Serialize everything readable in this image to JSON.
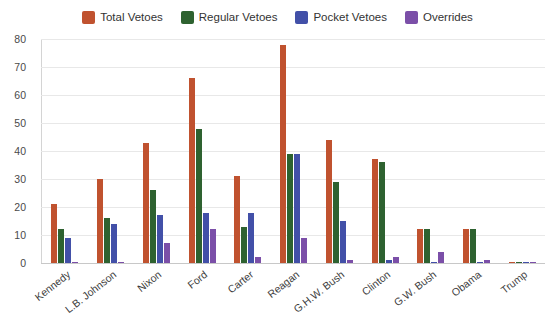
{
  "chart_data": {
    "type": "bar",
    "title": "",
    "subtitle": "",
    "xlabel": "",
    "ylabel": "",
    "ylim": [
      0,
      80
    ],
    "yticks": [
      0,
      10,
      20,
      30,
      40,
      50,
      60,
      70,
      80
    ],
    "grid": true,
    "legend_position": "top-center",
    "categories": [
      "Kennedy",
      "L.B. Johnson",
      "Nixon",
      "Ford",
      "Carter",
      "Reagan",
      "G.H.W. Bush",
      "Clinton",
      "G.W. Bush",
      "Obama",
      "Trump"
    ],
    "series": [
      {
        "name": "Total Vetoes",
        "color": "#c0522f",
        "values": [
          21,
          30,
          43,
          66,
          31,
          78,
          44,
          37,
          12,
          12,
          0
        ]
      },
      {
        "name": "Regular Vetoes",
        "color": "#2e6230",
        "values": [
          12,
          16,
          26,
          48,
          13,
          39,
          29,
          36,
          12,
          12,
          0
        ]
      },
      {
        "name": "Pocket Vetoes",
        "color": "#4250a8",
        "values": [
          9,
          14,
          17,
          18,
          18,
          39,
          15,
          1,
          0,
          0,
          0
        ]
      },
      {
        "name": "Overrides",
        "color": "#7b4fa8",
        "values": [
          0,
          0,
          7,
          12,
          2,
          9,
          1,
          2,
          4,
          1,
          0
        ]
      }
    ]
  },
  "legend": {
    "items": [
      {
        "label": "Total Vetoes",
        "color": "#c0522f"
      },
      {
        "label": "Regular Vetoes",
        "color": "#2e6230"
      },
      {
        "label": "Pocket Vetoes",
        "color": "#4250a8"
      },
      {
        "label": "Overrides",
        "color": "#7b4fa8"
      }
    ]
  },
  "colors": {
    "total_vetoes": "#c0522f",
    "regular_vetoes": "#2e6230",
    "pocket_vetoes": "#4250a8",
    "overrides": "#7b4fa8",
    "gridline": "#e8e8e8",
    "axis": "#c8c8c8",
    "background": "#ffffff",
    "text": "#3c3c3c"
  }
}
